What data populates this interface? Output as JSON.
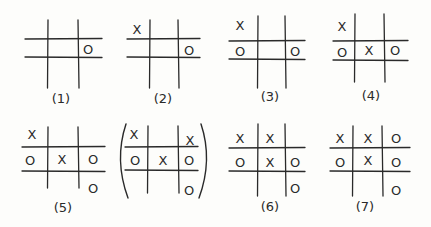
{
  "diagram": {
    "boards": [
      {
        "id": "1",
        "label": "(1)",
        "vlines": [
          48,
          78
        ],
        "hlines": [
          39,
          57
        ],
        "vspan": [
          20,
          88
        ],
        "hspan": [
          25,
          102
        ],
        "marks": [
          {
            "s": "O",
            "x": 88,
            "y": 49
          }
        ],
        "label_pos": [
          61,
          98
        ]
      },
      {
        "id": "2",
        "label": "(2)",
        "vlines": [
          150,
          178
        ],
        "hlines": [
          39,
          57
        ],
        "vspan": [
          20,
          88
        ],
        "hspan": [
          127,
          200
        ],
        "marks": [
          {
            "s": "X",
            "x": 137,
            "y": 29
          },
          {
            "s": "O",
            "x": 189,
            "y": 50
          }
        ],
        "label_pos": [
          163,
          98
        ]
      },
      {
        "id": "3",
        "label": "(3)",
        "vlines": [
          258,
          285
        ],
        "hlines": [
          41,
          59
        ],
        "vspan": [
          16,
          88
        ],
        "hspan": [
          229,
          305
        ],
        "marks": [
          {
            "s": "X",
            "x": 240,
            "y": 25
          },
          {
            "s": "O",
            "x": 240,
            "y": 51
          },
          {
            "s": "O",
            "x": 295,
            "y": 51
          }
        ],
        "label_pos": [
          270,
          96
        ]
      },
      {
        "id": "4",
        "label": "(4)",
        "vlines": [
          355,
          384
        ],
        "hlines": [
          41,
          60
        ],
        "vspan": [
          14,
          82
        ],
        "hspan": [
          333,
          408
        ],
        "marks": [
          {
            "s": "X",
            "x": 342,
            "y": 26
          },
          {
            "s": "O",
            "x": 342,
            "y": 52
          },
          {
            "s": "X",
            "x": 369,
            "y": 50
          },
          {
            "s": "O",
            "x": 395,
            "y": 50
          }
        ],
        "label_pos": [
          371,
          95
        ]
      },
      {
        "id": "5",
        "label": "(5)",
        "vlines": [
          48,
          78
        ],
        "hlines": [
          147,
          171
        ],
        "vspan": [
          127,
          188
        ],
        "hspan": [
          22,
          105
        ],
        "marks": [
          {
            "s": "X",
            "x": 32,
            "y": 134
          },
          {
            "s": "O",
            "x": 30,
            "y": 160
          },
          {
            "s": "X",
            "x": 62,
            "y": 159
          },
          {
            "s": "O",
            "x": 93,
            "y": 159
          },
          {
            "s": "O",
            "x": 93,
            "y": 188
          }
        ],
        "label_pos": [
          63,
          207
        ]
      },
      {
        "id": "5b",
        "label": "",
        "parenthesized": true,
        "vlines": [
          148,
          178
        ],
        "hlines": [
          147,
          170
        ],
        "vspan": [
          126,
          193
        ],
        "hspan": [
          125,
          198
        ],
        "marks": [
          {
            "s": "X",
            "x": 134,
            "y": 134
          },
          {
            "s": "X",
            "x": 190,
            "y": 140
          },
          {
            "s": "O",
            "x": 135,
            "y": 160
          },
          {
            "s": "X",
            "x": 163,
            "y": 160
          },
          {
            "s": "O",
            "x": 189,
            "y": 160
          },
          {
            "s": "O",
            "x": 189,
            "y": 190
          }
        ],
        "paren_x": [
          120,
          205
        ]
      },
      {
        "id": "6",
        "label": "(6)",
        "vlines": [
          258,
          285
        ],
        "hlines": [
          148,
          171
        ],
        "vspan": [
          124,
          196
        ],
        "hspan": [
          229,
          305
        ],
        "marks": [
          {
            "s": "X",
            "x": 240,
            "y": 138
          },
          {
            "s": "X",
            "x": 270,
            "y": 138
          },
          {
            "s": "O",
            "x": 240,
            "y": 162
          },
          {
            "s": "X",
            "x": 270,
            "y": 162
          },
          {
            "s": "O",
            "x": 295,
            "y": 162
          },
          {
            "s": "O",
            "x": 295,
            "y": 188
          }
        ],
        "label_pos": [
          270,
          206
        ]
      },
      {
        "id": "7",
        "label": "(7)",
        "vlines": [
          353,
          382
        ],
        "hlines": [
          148,
          171
        ],
        "vspan": [
          126,
          196
        ],
        "hspan": [
          330,
          410
        ],
        "marks": [
          {
            "s": "X",
            "x": 340,
            "y": 138
          },
          {
            "s": "X",
            "x": 368,
            "y": 138
          },
          {
            "s": "O",
            "x": 396,
            "y": 138
          },
          {
            "s": "O",
            "x": 340,
            "y": 162
          },
          {
            "s": "X",
            "x": 368,
            "y": 160
          },
          {
            "s": "O",
            "x": 396,
            "y": 162
          },
          {
            "s": "O",
            "x": 396,
            "y": 190
          }
        ],
        "label_pos": [
          365,
          206
        ]
      }
    ]
  }
}
